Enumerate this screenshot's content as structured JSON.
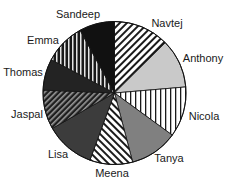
{
  "chart_data": {
    "type": "pie",
    "title": "",
    "start_angle_deg": 0,
    "direction": "clockwise",
    "center": [
      114.5,
      93
    ],
    "radius": 71.5,
    "categories": [
      "Navtej",
      "Anthony",
      "Nicola",
      "Tanya",
      "Meena",
      "Lisa",
      "Jaspal",
      "Thomas",
      "Emma",
      "Sandeep"
    ],
    "values": [
      12.6,
      11.1,
      11.4,
      10.9,
      9.7,
      11.2,
      8.9,
      7.1,
      9.3,
      8.0
    ],
    "slices": [
      {
        "label": "Navtej",
        "value": 12.6,
        "fill": "hatch-fwd",
        "label_pos": [
          167,
          27
        ]
      },
      {
        "label": "Anthony",
        "value": 11.1,
        "fill": "#c9c9c9",
        "label_pos": [
          203,
          62
        ]
      },
      {
        "label": "Nicola",
        "value": 11.4,
        "fill": "vstripe-light",
        "label_pos": [
          204,
          120
        ]
      },
      {
        "label": "Tanya",
        "value": 10.9,
        "fill": "#808080",
        "label_pos": [
          169,
          162
        ]
      },
      {
        "label": "Meena",
        "value": 9.7,
        "fill": "hatch-back",
        "label_pos": [
          112,
          177
        ]
      },
      {
        "label": "Lisa",
        "value": 11.2,
        "fill": "#3c3c3c",
        "label_pos": [
          58,
          158
        ]
      },
      {
        "label": "Jaspal",
        "value": 8.9,
        "fill": "hatch-dark",
        "label_pos": [
          27,
          118
        ]
      },
      {
        "label": "Thomas",
        "value": 7.1,
        "fill": "#232323",
        "label_pos": [
          23,
          76
        ]
      },
      {
        "label": "Emma",
        "value": 9.3,
        "fill": "vstripe-dark",
        "label_pos": [
          43,
          44
        ]
      },
      {
        "label": "Sandeep",
        "value": 8.0,
        "fill": "#111111",
        "label_pos": [
          78,
          18
        ]
      }
    ],
    "legend": "none (direct labels)",
    "grid": false
  }
}
